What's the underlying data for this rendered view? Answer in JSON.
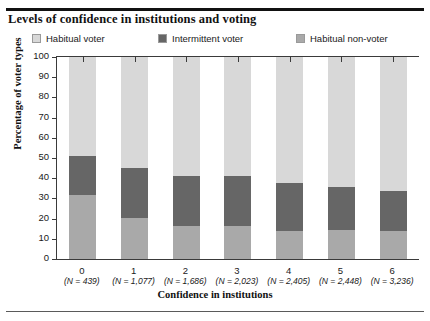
{
  "figure": {
    "title": "Levels of confidence in institutions and voting"
  },
  "legend": {
    "items": [
      {
        "label": "Habitual voter",
        "color": "#d8d8d8",
        "name": "legend-habitual-voter"
      },
      {
        "label": "Intermittent voter",
        "color": "#666666",
        "name": "legend-intermittent-voter"
      },
      {
        "label": "Habitual non-voter",
        "color": "#a9a9a9",
        "name": "legend-habitual-non-voter"
      }
    ]
  },
  "chart_data": {
    "type": "bar",
    "subtype": "stacked-percentage",
    "title": "Levels of confidence in institutions and voting",
    "xlabel": "Confidence in institutions",
    "ylabel": "Percentage of voter types",
    "ylim": [
      0,
      100
    ],
    "yticks": [
      0,
      10,
      20,
      30,
      40,
      50,
      60,
      70,
      80,
      90,
      100
    ],
    "grid": false,
    "legend_position": "top",
    "categories": [
      "0",
      "1",
      "2",
      "3",
      "4",
      "5",
      "6"
    ],
    "category_notes": [
      "(N = 439)",
      "(N = 1,077)",
      "(N = 1,686)",
      "(N = 2,023)",
      "(N = 2,405)",
      "(N = 2,448)",
      "(N = 3,236)"
    ],
    "sample_sizes": [
      439,
      1077,
      1686,
      2023,
      2405,
      2448,
      3236
    ],
    "series": [
      {
        "name": "Habitual non-voter",
        "color": "#a9a9a9",
        "values": [
          31.5,
          20.5,
          16.5,
          16.5,
          14,
          14.5,
          14
        ]
      },
      {
        "name": "Intermittent voter",
        "color": "#666666",
        "values": [
          19.5,
          24.5,
          24.5,
          24.5,
          23.5,
          21,
          19.5
        ]
      },
      {
        "name": "Habitual voter",
        "color": "#d8d8d8",
        "values": [
          49,
          55,
          59,
          59,
          62.5,
          64.5,
          66.5
        ]
      }
    ],
    "stack_order_bottom_to_top": [
      "Habitual non-voter",
      "Intermittent voter",
      "Habitual voter"
    ]
  }
}
